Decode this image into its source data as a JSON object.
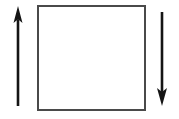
{
  "canvas": {
    "width": 179,
    "height": 119,
    "background": "#ffffff",
    "title": "square-with-up-and-down-arrows"
  },
  "colors": {
    "arrow": "#151515",
    "square_stroke": "#4a4a4a",
    "square_fill": "#ffffff"
  },
  "shapes": {
    "square": {
      "name": "square",
      "x": 38,
      "y": 6,
      "width": 107,
      "height": 104,
      "stroke_width": 1.6
    },
    "left_arrow": {
      "name": "up-arrow",
      "direction": "up",
      "x": 18,
      "tail_y": 106,
      "tip_y": 6,
      "shaft_width": 2.6,
      "head_width": 9,
      "head_height": 17
    },
    "right_arrow": {
      "name": "down-arrow",
      "direction": "down",
      "x": 162,
      "tail_y": 12,
      "tip_y": 106,
      "shaft_width": 2.6,
      "head_width": 10,
      "head_height": 18
    }
  }
}
